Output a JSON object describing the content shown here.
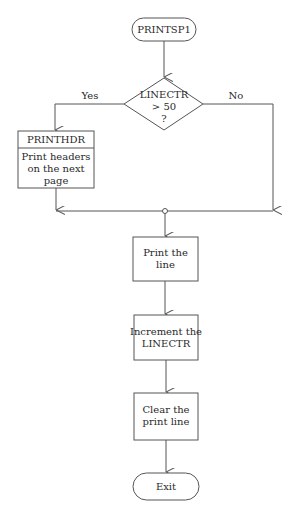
{
  "diagram": {
    "type": "flowchart",
    "nodes": {
      "start": {
        "shape": "terminator",
        "label": "PRINTSP1"
      },
      "decision": {
        "shape": "diamond",
        "lines": [
          "LINECTR",
          "> 50",
          "?"
        ]
      },
      "printhdr": {
        "shape": "predefined-process",
        "title": "PRINTHDR",
        "lines": [
          "Print headers",
          "on the next",
          "page"
        ]
      },
      "print_line": {
        "shape": "process",
        "lines": [
          "Print the",
          "line"
        ]
      },
      "increment": {
        "shape": "process",
        "lines": [
          "Increment the",
          "LINECTR"
        ]
      },
      "clear": {
        "shape": "process",
        "lines": [
          "Clear the",
          "print line"
        ]
      },
      "exit": {
        "shape": "terminator",
        "label": "Exit"
      }
    },
    "edges": {
      "yes_label": "Yes",
      "no_label": "No"
    },
    "colors": {
      "line": "#555555",
      "text": "#2a2a2a",
      "background": "#ffffff"
    }
  }
}
